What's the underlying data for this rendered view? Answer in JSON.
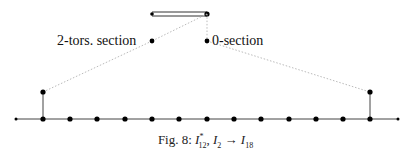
{
  "labels": {
    "torsion_section": "2-tors. section",
    "zero_section": "0-section"
  },
  "caption": {
    "prefix": "Fig. 8: ",
    "fiber1_letter": "I",
    "fiber1_sub": "12",
    "fiber1_sup": "*",
    "sep": ", ",
    "fiber2_letter": "I",
    "fiber2_sub": "2",
    "arrow": " → ",
    "result_letter": "I",
    "result_sub": "18"
  },
  "diagram": {
    "colors": {
      "line": "#333333",
      "node": "#000000",
      "dotted": "#bbbbbb"
    },
    "top_bar": {
      "x1": 152,
      "x2": 207,
      "y": 14
    },
    "section_nodes": [
      {
        "name": "torsion",
        "x": 152,
        "y": 41
      },
      {
        "name": "zero",
        "x": 207,
        "y": 41
      }
    ],
    "chain_y": 119,
    "chain_nodes_x": [
      43,
      70,
      97,
      125,
      152,
      179,
      207,
      234,
      261,
      289,
      316,
      343,
      370
    ],
    "chain_end_dots_x": [
      16,
      398
    ],
    "branches": [
      {
        "x": 43,
        "y_top": 92
      },
      {
        "x": 370,
        "y_top": 92
      }
    ]
  }
}
